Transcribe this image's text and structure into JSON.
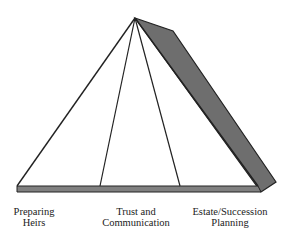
{
  "diagram": {
    "title": "",
    "colors": {
      "stroke": "#222222",
      "shade": "#6e6e6e",
      "base": "#808080",
      "background": "#ffffff"
    },
    "pillars": [
      {
        "line1": "Preparing",
        "line2": "Heirs"
      },
      {
        "line1": "Trust and",
        "line2": "Communication"
      },
      {
        "line1": "Estate/Succession",
        "line2": "Planning"
      }
    ]
  }
}
